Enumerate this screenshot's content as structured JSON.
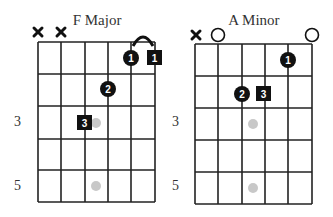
{
  "diagrams": [
    {
      "title": "F Major",
      "fret_labels": [
        {
          "fret": 3,
          "label": "3"
        },
        {
          "fret": 5,
          "label": "5"
        }
      ],
      "string_markers": [
        {
          "string": 1,
          "type": "muted"
        },
        {
          "string": 2,
          "type": "muted"
        }
      ],
      "fingers": [
        {
          "string": 5,
          "fret": 1,
          "finger": "1",
          "shape": "circle"
        },
        {
          "string": 6,
          "fret": 1,
          "finger": "1",
          "shape": "square",
          "barre_arc_from_string": 5
        },
        {
          "string": 4,
          "fret": 2,
          "finger": "2",
          "shape": "circle"
        },
        {
          "string": 3,
          "fret": 3,
          "finger": "3",
          "shape": "square"
        }
      ],
      "inlays": [
        {
          "between_strings": "3-4",
          "fret": 3
        },
        {
          "between_strings": "3-4",
          "fret": 5
        }
      ]
    },
    {
      "title": "A Minor",
      "fret_labels": [
        {
          "fret": 3,
          "label": "3"
        },
        {
          "fret": 5,
          "label": "5"
        }
      ],
      "string_markers": [
        {
          "string": 1,
          "type": "muted"
        },
        {
          "string": 2,
          "type": "open"
        },
        {
          "string": 6,
          "type": "open"
        }
      ],
      "fingers": [
        {
          "string": 5,
          "fret": 1,
          "finger": "1",
          "shape": "circle"
        },
        {
          "string": 3,
          "fret": 2,
          "finger": "2",
          "shape": "circle"
        },
        {
          "string": 4,
          "fret": 2,
          "finger": "3",
          "shape": "square"
        }
      ],
      "inlays": [
        {
          "between_strings": "3-4",
          "fret": 3
        },
        {
          "between_strings": "3-4",
          "fret": 5
        }
      ]
    }
  ],
  "colors": {
    "grid": "#222222",
    "finger": "#111111",
    "finger_text": "#ffffff",
    "inlay": "#c8c8c8",
    "text": "#333333"
  }
}
